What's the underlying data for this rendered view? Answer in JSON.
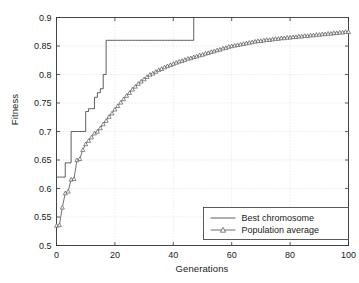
{
  "chart_data": {
    "type": "line",
    "title": "",
    "xlabel": "Generations",
    "ylabel": "Fitness",
    "xlim": [
      0,
      100
    ],
    "ylim": [
      0.5,
      0.9
    ],
    "xticks": [
      0,
      20,
      40,
      60,
      80,
      100
    ],
    "yticks": [
      0.5,
      0.55,
      0.6,
      0.65,
      0.7,
      0.75,
      0.8,
      0.85,
      0.9
    ],
    "xticklabels": [
      "0",
      "20",
      "40",
      "60",
      "80",
      "100"
    ],
    "yticklabels": [
      "0.5",
      "0.55",
      "0.6",
      "0.65",
      "0.7",
      "0.75",
      "0.8",
      "0.85",
      "0.9"
    ],
    "grid": true,
    "grid_style": "dotted",
    "legend_position": "lower right",
    "line_color": "#4d4d4d",
    "marker": "triangle-up-open",
    "x": [
      0,
      1,
      2,
      3,
      4,
      5,
      6,
      7,
      8,
      9,
      10,
      11,
      12,
      13,
      14,
      15,
      16,
      17,
      18,
      19,
      20,
      21,
      22,
      23,
      24,
      25,
      26,
      27,
      28,
      29,
      30,
      31,
      32,
      33,
      34,
      35,
      36,
      37,
      38,
      39,
      40,
      41,
      42,
      43,
      44,
      45,
      46,
      47,
      48,
      49,
      50,
      51,
      52,
      53,
      54,
      55,
      56,
      57,
      58,
      59,
      60,
      61,
      62,
      63,
      64,
      65,
      66,
      67,
      68,
      69,
      70,
      71,
      72,
      73,
      74,
      75,
      76,
      77,
      78,
      79,
      80,
      81,
      82,
      83,
      84,
      85,
      86,
      87,
      88,
      89,
      90,
      91,
      92,
      93,
      94,
      95,
      96,
      97,
      98,
      99,
      100
    ],
    "series": [
      {
        "name": "Best chromosome",
        "style": "solid",
        "marker": "none",
        "values": [
          0.62,
          0.62,
          0.62,
          0.645,
          0.645,
          0.7,
          0.7,
          0.7,
          0.7,
          0.7,
          0.735,
          0.74,
          0.74,
          0.76,
          0.768,
          0.775,
          0.8,
          0.86,
          0.86,
          0.86,
          0.86,
          0.86,
          0.86,
          0.86,
          0.86,
          0.86,
          0.86,
          0.86,
          0.86,
          0.86,
          0.86,
          0.86,
          0.86,
          0.86,
          0.86,
          0.86,
          0.86,
          0.86,
          0.86,
          0.86,
          0.86,
          0.86,
          0.86,
          0.86,
          0.86,
          0.86,
          0.86,
          0.9,
          0.9,
          0.9,
          0.9,
          0.9,
          0.9,
          0.9,
          0.9,
          0.9,
          0.9,
          0.9,
          0.9,
          0.9,
          0.9,
          0.9,
          0.9,
          0.9,
          0.9,
          0.9,
          0.9,
          0.9,
          0.9,
          0.9,
          0.9,
          0.9,
          0.9,
          0.9,
          0.9,
          0.9,
          0.9,
          0.9,
          0.9,
          0.9,
          0.9,
          0.9,
          0.9,
          0.9,
          0.9,
          0.9,
          0.9,
          0.9,
          0.9,
          0.9,
          0.9,
          0.9,
          0.9,
          0.9,
          0.9,
          0.9,
          0.9,
          0.9,
          0.9,
          0.9,
          0.9
        ]
      },
      {
        "name": "Population average",
        "style": "solid",
        "marker": "triangle-up-open",
        "values": [
          0.535,
          0.536,
          0.567,
          0.592,
          0.595,
          0.616,
          0.617,
          0.65,
          0.652,
          0.668,
          0.678,
          0.684,
          0.69,
          0.697,
          0.7,
          0.706,
          0.713,
          0.719,
          0.726,
          0.732,
          0.739,
          0.745,
          0.751,
          0.757,
          0.763,
          0.768,
          0.774,
          0.779,
          0.784,
          0.788,
          0.792,
          0.796,
          0.8,
          0.802,
          0.805,
          0.808,
          0.81,
          0.813,
          0.815,
          0.817,
          0.819,
          0.821,
          0.823,
          0.824,
          0.826,
          0.828,
          0.829,
          0.831,
          0.832,
          0.834,
          0.835,
          0.837,
          0.838,
          0.84,
          0.841,
          0.843,
          0.844,
          0.846,
          0.847,
          0.849,
          0.85,
          0.851,
          0.852,
          0.853,
          0.854,
          0.855,
          0.856,
          0.857,
          0.858,
          0.859,
          0.859,
          0.86,
          0.861,
          0.861,
          0.862,
          0.863,
          0.863,
          0.864,
          0.864,
          0.865,
          0.865,
          0.866,
          0.866,
          0.867,
          0.867,
          0.868,
          0.868,
          0.869,
          0.869,
          0.87,
          0.87,
          0.871,
          0.871,
          0.872,
          0.872,
          0.873,
          0.873,
          0.874,
          0.874,
          0.875,
          0.875
        ]
      }
    ]
  },
  "legend": {
    "items": [
      {
        "label": "Best chromosome",
        "marker": "none"
      },
      {
        "label": "Population average",
        "marker": "triangle-up-open"
      }
    ]
  }
}
